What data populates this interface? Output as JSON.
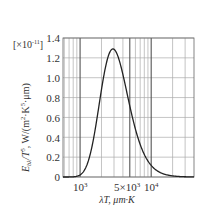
{
  "chart_data": {
    "type": "line",
    "title": "",
    "xlabel": "λT, μm·K",
    "ylabel": "E_bλ/T^5, W/(m²·K⁵·μm)",
    "y_multiplier": "[×10⁻¹¹]",
    "x_scale": "log",
    "xlim": [
      575,
      40000
    ],
    "ylim": [
      0,
      1.4
    ],
    "grid": true,
    "legend": null,
    "y_ticks": [
      0,
      0.2,
      0.4,
      0.6,
      0.8,
      1.0,
      1.2,
      1.4
    ],
    "y_tick_labels": [
      "0",
      "0.2",
      "0.4",
      "0.6",
      "0.8",
      "1.0",
      "1.2",
      "1.4"
    ],
    "x_tick_labels": [
      {
        "value": 1000,
        "label": "10³"
      },
      {
        "value": 5000,
        "label": "5×10³"
      },
      {
        "value": 10000,
        "label": "10⁴"
      }
    ],
    "series": [
      {
        "name": "Planck distribution (normalized)",
        "x": [
          600,
          800,
          1000,
          1200,
          1500,
          1800,
          2000,
          2400,
          2898,
          3500,
          4000,
          5000,
          6000,
          7000,
          8000,
          10000,
          12000,
          15000,
          20000,
          30000,
          40000
        ],
        "values": [
          0.0,
          0.003,
          0.021,
          0.08,
          0.27,
          0.55,
          0.73,
          1.03,
          1.29,
          1.22,
          1.07,
          0.75,
          0.5,
          0.34,
          0.24,
          0.12,
          0.068,
          0.033,
          0.012,
          0.003,
          0.001
        ]
      }
    ]
  },
  "labels": {
    "multiplier": "[×10",
    "multiplier_exp": "-11",
    "multiplier_close": "]",
    "ylabel_main": "E",
    "ylabel_sub": "bλ",
    "ylabel_rest": "/T",
    "ylabel_exp5": "5",
    "ylabel_units": ", W/(m",
    "ylabel_exp2": "2",
    "ylabel_units2": "·K",
    "ylabel_exp5b": "5",
    "ylabel_units3": "·μm)",
    "xlabel": "λT, μm·K",
    "xt_1000_base": "10",
    "xt_1000_exp": "3",
    "xt_5000_base": "5×10",
    "xt_5000_exp": "3",
    "xt_10000_base": "10",
    "xt_10000_exp": "4",
    "y0": "0",
    "y1": "0.2",
    "y2": "0.4",
    "y3": "0.6",
    "y4": "0.8",
    "y5": "1.0",
    "y6": "1.2",
    "y7": "1.4"
  },
  "colors": {
    "curve": "#222222",
    "grid_major": "#555555",
    "grid_minor": "#aaaaaa",
    "text": "#333333"
  }
}
